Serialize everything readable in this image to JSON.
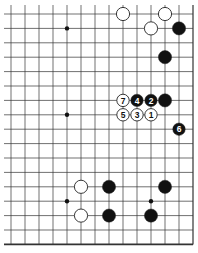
{
  "board": {
    "title": "Go board diagram (corner section)",
    "columns": 14,
    "rows": 17,
    "origin_x": 11,
    "origin_y": 14,
    "spacing_x": 14,
    "spacing_y": 14.4,
    "edges": {
      "right": true,
      "bottom": true,
      "top": false,
      "left": false
    },
    "colors": {
      "line": "#333333",
      "black_stone": "#111111",
      "white_stone": "#ffffff",
      "stone_outline": "#222222",
      "background": "#ffffff"
    },
    "star_points": [
      {
        "col": 4,
        "row": 1
      },
      {
        "col": 4,
        "row": 7
      },
      {
        "col": 4,
        "row": 13
      },
      {
        "col": 10,
        "row": 13
      }
    ],
    "stones": [
      {
        "color": "white",
        "col": 8,
        "row": 0,
        "label": ""
      },
      {
        "color": "white",
        "col": 11,
        "row": 0,
        "label": ""
      },
      {
        "color": "white",
        "col": 10,
        "row": 1,
        "label": ""
      },
      {
        "color": "black",
        "col": 12,
        "row": 1,
        "label": ""
      },
      {
        "color": "black",
        "col": 11,
        "row": 3,
        "label": ""
      },
      {
        "color": "white",
        "col": 8,
        "row": 6,
        "label": "7"
      },
      {
        "color": "black",
        "col": 9,
        "row": 6,
        "label": "4"
      },
      {
        "color": "black",
        "col": 10,
        "row": 6,
        "label": "2"
      },
      {
        "color": "black",
        "col": 11,
        "row": 6,
        "label": ""
      },
      {
        "color": "white",
        "col": 8,
        "row": 7,
        "label": "5"
      },
      {
        "color": "white",
        "col": 9,
        "row": 7,
        "label": "3"
      },
      {
        "color": "white",
        "col": 10,
        "row": 7,
        "label": "1"
      },
      {
        "color": "black",
        "col": 12,
        "row": 8,
        "label": "6"
      },
      {
        "color": "white",
        "col": 5,
        "row": 12,
        "label": ""
      },
      {
        "color": "black",
        "col": 7,
        "row": 12,
        "label": ""
      },
      {
        "color": "black",
        "col": 11,
        "row": 12,
        "label": ""
      },
      {
        "color": "white",
        "col": 5,
        "row": 14,
        "label": ""
      },
      {
        "color": "black",
        "col": 7,
        "row": 14,
        "label": ""
      },
      {
        "color": "black",
        "col": 10,
        "row": 14,
        "label": ""
      }
    ]
  },
  "caption": {
    "text": ""
  }
}
